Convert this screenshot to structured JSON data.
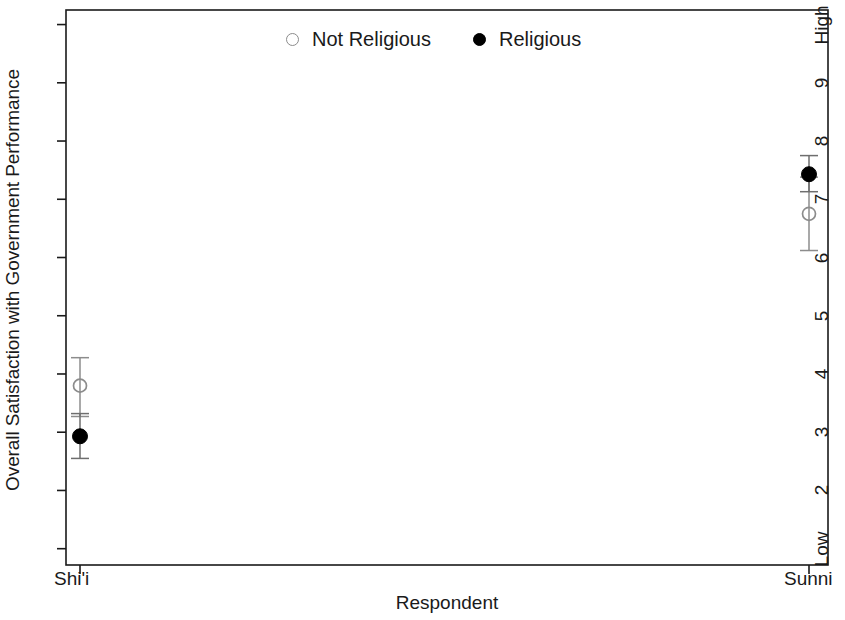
{
  "chart_data": {
    "type": "scatter",
    "title": "",
    "xlabel": "Respondent",
    "ylabel": "Overall Satisfaction with Government Performance",
    "categories": [
      "Shi'i",
      "Sunni"
    ],
    "x_tick_labels": [
      "Shi'i",
      "Sunni"
    ],
    "y_tick_labels": [
      "Low",
      "2",
      "3",
      "4",
      "5",
      "6",
      "7",
      "8",
      "9",
      "High"
    ],
    "y_tick_values": [
      1,
      2,
      3,
      4,
      5,
      6,
      7,
      8,
      9,
      10
    ],
    "ylim": [
      0.72,
      10.25
    ],
    "grid": false,
    "legend_position": "top-center",
    "error_bars": true,
    "series": [
      {
        "name": "Not Religious",
        "marker": "open-circle",
        "color": "#8c8c8c",
        "values": [
          3.8,
          6.75
        ],
        "ci_low": [
          3.27,
          6.12
        ],
        "ci_high": [
          4.28,
          7.38
        ]
      },
      {
        "name": "Religious",
        "marker": "filled-circle",
        "color": "#000000",
        "values": [
          2.93,
          7.43
        ],
        "ci_low": [
          2.55,
          7.13
        ],
        "ci_high": [
          3.32,
          7.75
        ]
      }
    ]
  },
  "legend": {
    "entries": [
      {
        "label": "Not Religious",
        "marker": "open-circle"
      },
      {
        "label": "Religious",
        "marker": "filled-circle"
      }
    ]
  },
  "axes": {
    "x_title": "Respondent",
    "y_title": "Overall Satisfaction with Government Performance"
  },
  "colors": {
    "frame": "#1a1a1a",
    "not_religious": "#8c8c8c",
    "religious": "#000000",
    "background": "#ffffff"
  }
}
